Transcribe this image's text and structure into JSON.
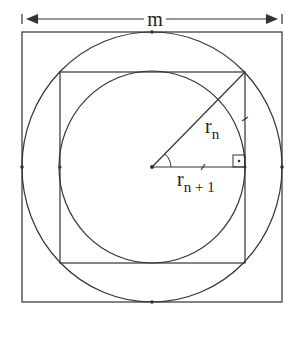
{
  "diagram": {
    "title_label": "m",
    "labels": {
      "r_n": {
        "base": "r",
        "sub": "n"
      },
      "r_n1": {
        "base": "r",
        "sub": "n + 1"
      }
    },
    "shapes": {
      "outer_square": {
        "x": 22,
        "y": 32,
        "w": 260,
        "h": 270
      },
      "outer_circle": {
        "cx": 152,
        "cy": 167,
        "r": 131
      },
      "inner_square": {
        "x": 60,
        "y": 72,
        "w": 185,
        "h": 191
      },
      "inner_circle": {
        "cx": 152,
        "cy": 167,
        "r": 93
      }
    },
    "colors": {
      "stroke": "#333333",
      "background": "#ffffff"
    }
  }
}
